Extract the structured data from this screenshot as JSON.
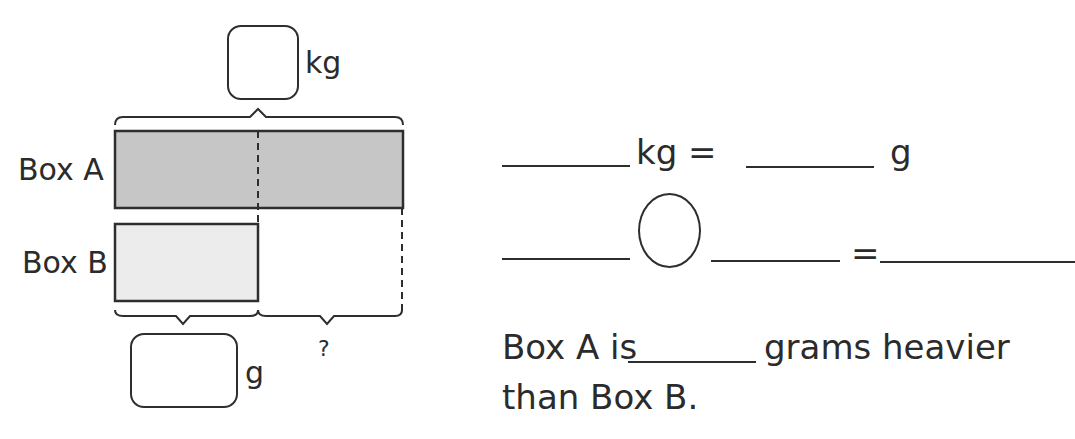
{
  "diagram": {
    "total_unit": "kg",
    "box_a_label": "Box A",
    "box_b_label": "Box B",
    "box_b_unit": "g",
    "difference_mark": "?",
    "colors": {
      "box_a_fill": "#c6c6c6",
      "box_b_fill": "#ececec",
      "stroke": "#2e2e2e"
    }
  },
  "equations": {
    "line1": {
      "unit1": "kg =",
      "unit2": "g"
    },
    "line2": {
      "equals": "="
    },
    "sentence_part1": "Box A is",
    "sentence_part2": "grams heavier",
    "sentence_line2": "than Box B."
  }
}
